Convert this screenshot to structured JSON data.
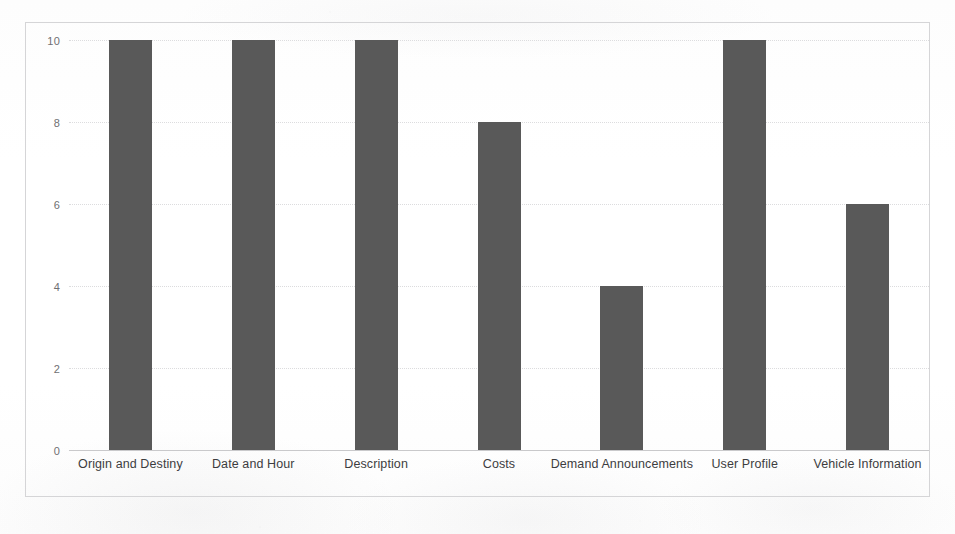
{
  "chart_data": {
    "type": "bar",
    "title": "",
    "subtitle": "",
    "xlabel": "",
    "ylabel": "",
    "ylim": [
      0,
      10
    ],
    "yticks": [
      0,
      2,
      4,
      6,
      8,
      10
    ],
    "ytick_labels": [
      "0",
      "2",
      "4",
      "6",
      "8",
      "10"
    ],
    "grid": true,
    "legend": false,
    "legend_position": "none",
    "bar_color": "#595959",
    "gridline_color": "#dcdcde",
    "axis_color": "#c9c9cb",
    "frame_color": "#d5d5d7",
    "background_color": "#ffffff",
    "categories": [
      "Origin and Destiny",
      "Date and Hour",
      "Description",
      "Costs",
      "Demand Announcements",
      "User Profile",
      "Vehicle Information"
    ],
    "values": [
      10,
      10,
      10,
      8,
      4,
      10,
      6
    ],
    "series": [
      {
        "name": "",
        "values": [
          10,
          10,
          10,
          8,
          4,
          10,
          6
        ]
      }
    ],
    "points": [
      {
        "category": "Origin and Destiny",
        "value": 10
      },
      {
        "category": "Date and Hour",
        "value": 10
      },
      {
        "category": "Description",
        "value": 10
      },
      {
        "category": "Costs",
        "value": 8
      },
      {
        "category": "Demand Announcements",
        "value": 4
      },
      {
        "category": "User Profile",
        "value": 10
      },
      {
        "category": "Vehicle Information",
        "value": 6
      }
    ],
    "annotations": []
  }
}
